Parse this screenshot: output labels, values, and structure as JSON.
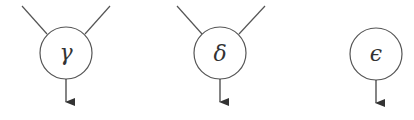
{
  "diagram": {
    "stroke_color": "#555555",
    "nodes": [
      {
        "id": "gamma",
        "label": "γ",
        "cx": 66,
        "cy": 53,
        "r": 26,
        "inputs": 2
      },
      {
        "id": "delta",
        "label": "δ",
        "cx": 220,
        "cy": 53,
        "r": 26,
        "inputs": 2
      },
      {
        "id": "epsilon",
        "label": "ϵ",
        "cx": 376,
        "cy": 54,
        "r": 26,
        "inputs": 0
      }
    ]
  }
}
